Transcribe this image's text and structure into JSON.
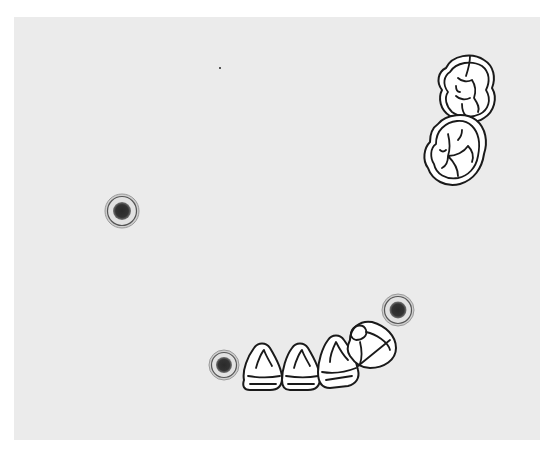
{
  "diagram": {
    "type": "dental-chart",
    "background_color": "#ebebeb",
    "outline_color": "#1a1a1a",
    "implant_markers": [
      {
        "id": "marker-left",
        "cx": 122,
        "cy": 211,
        "r_outer": 17,
        "r_core": 9
      },
      {
        "id": "marker-right",
        "cx": 398,
        "cy": 310,
        "r_outer": 16,
        "r_core": 8
      },
      {
        "id": "marker-lower",
        "cx": 224,
        "cy": 365,
        "r_outer": 15,
        "r_core": 8
      }
    ],
    "upper_teeth": [
      {
        "id": "molar-upper-1",
        "type": "molar"
      },
      {
        "id": "molar-upper-2",
        "type": "molar"
      }
    ],
    "lower_teeth": [
      {
        "id": "tooth-lower-1",
        "type": "incisor"
      },
      {
        "id": "tooth-lower-2",
        "type": "incisor"
      },
      {
        "id": "tooth-lower-3",
        "type": "canine"
      },
      {
        "id": "tooth-lower-4",
        "type": "premolar"
      }
    ]
  }
}
